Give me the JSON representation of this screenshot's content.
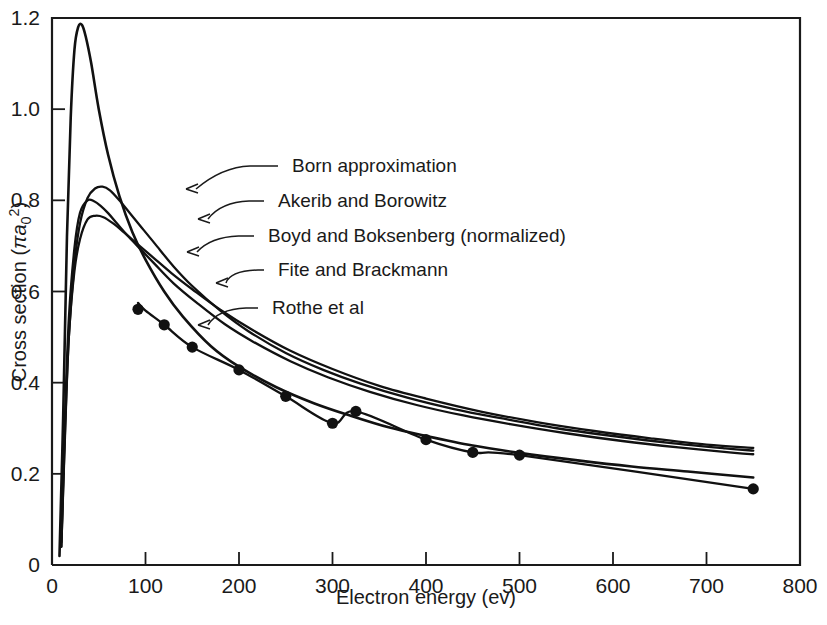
{
  "chart_data": {
    "type": "line",
    "title": "",
    "xlabel": "Electron energy (ev)",
    "ylabel": "Cross section (πa₀²)",
    "xlim": [
      0,
      800
    ],
    "ylim": [
      0,
      1.2
    ],
    "grid": false,
    "legend_position": "inline-annotations",
    "xticks": [
      0,
      100,
      200,
      300,
      400,
      500,
      600,
      700,
      800
    ],
    "xtick_labels": [
      "0",
      "100",
      "200",
      "300",
      "400",
      "500",
      "600",
      "700",
      "800"
    ],
    "yticks": [
      0,
      0.2,
      0.4,
      0.6,
      0.8,
      1.0,
      1.2
    ],
    "ytick_labels": [
      "0",
      "0.2",
      "0.4",
      "0.6",
      "0.8",
      "1.0",
      "1.2"
    ],
    "series": [
      {
        "name": "Born approximation",
        "style": "line",
        "x": [
          8,
          12,
          16,
          20,
          24,
          28,
          32,
          36,
          42,
          50,
          60,
          72,
          86,
          100,
          120,
          140,
          170,
          200,
          240,
          280,
          320,
          360,
          400,
          450,
          500,
          560,
          620,
          680,
          750
        ],
        "values": [
          0.02,
          0.33,
          0.72,
          0.98,
          1.13,
          1.18,
          1.185,
          1.16,
          1.1,
          1.0,
          0.9,
          0.81,
          0.73,
          0.67,
          0.6,
          0.545,
          0.48,
          0.435,
          0.39,
          0.355,
          0.327,
          0.302,
          0.283,
          0.262,
          0.246,
          0.23,
          0.216,
          0.205,
          0.192
        ]
      },
      {
        "name": "Akerib and Borowitz",
        "style": "line",
        "x": [
          10,
          14,
          18,
          24,
          30,
          38,
          46,
          54,
          62,
          72,
          84,
          96,
          110,
          130,
          150,
          180,
          210,
          250,
          290,
          330,
          380,
          430,
          480,
          540,
          600,
          660,
          720,
          750
        ],
        "values": [
          0.04,
          0.3,
          0.5,
          0.66,
          0.75,
          0.805,
          0.826,
          0.83,
          0.822,
          0.8,
          0.77,
          0.74,
          0.705,
          0.655,
          0.612,
          0.558,
          0.513,
          0.465,
          0.428,
          0.398,
          0.367,
          0.342,
          0.322,
          0.3,
          0.283,
          0.268,
          0.256,
          0.251
        ]
      },
      {
        "name": "Boyd and Boksenberg (normalized)",
        "style": "line",
        "x": [
          10,
          14,
          18,
          24,
          30,
          38,
          45,
          52,
          60,
          70,
          82,
          95,
          110,
          130,
          155,
          185,
          215,
          255,
          295,
          340,
          390,
          440,
          490,
          550,
          610,
          670,
          730,
          750
        ],
        "values": [
          0.05,
          0.33,
          0.54,
          0.695,
          0.773,
          0.8,
          0.798,
          0.788,
          0.772,
          0.748,
          0.72,
          0.692,
          0.66,
          0.618,
          0.575,
          0.528,
          0.49,
          0.447,
          0.412,
          0.38,
          0.351,
          0.328,
          0.309,
          0.289,
          0.272,
          0.258,
          0.246,
          0.243
        ]
      },
      {
        "name": "Fite and Brackmann",
        "style": "line",
        "x": [
          10,
          14,
          18,
          24,
          30,
          38,
          46,
          55,
          65,
          78,
          92,
          108,
          128,
          150,
          180,
          215,
          255,
          300,
          350,
          400,
          460,
          520,
          580,
          640,
          700,
          750
        ],
        "values": [
          0.04,
          0.29,
          0.5,
          0.645,
          0.715,
          0.758,
          0.766,
          0.763,
          0.75,
          0.728,
          0.703,
          0.675,
          0.64,
          0.605,
          0.56,
          0.515,
          0.47,
          0.43,
          0.393,
          0.365,
          0.336,
          0.313,
          0.294,
          0.278,
          0.264,
          0.257
        ]
      },
      {
        "name": "Rothe et al",
        "style": "line+markers",
        "x": [
          92,
          100,
          120,
          150,
          200,
          250,
          300,
          325,
          400,
          450,
          500,
          750
        ],
        "values": [
          0.575,
          0.558,
          0.527,
          0.478,
          0.428,
          0.37,
          0.311,
          0.337,
          0.275,
          0.247,
          0.241,
          0.167
        ],
        "marker_x": [
          92,
          120,
          150,
          200,
          250,
          300,
          325,
          400,
          450,
          500,
          750
        ],
        "marker_values": [
          0.561,
          0.527,
          0.478,
          0.428,
          0.37,
          0.311,
          0.337,
          0.275,
          0.247,
          0.241,
          0.167
        ]
      }
    ],
    "annotations": [
      {
        "label": "Born approximation",
        "label_x": 292,
        "label_y": 172,
        "leader_x": 186,
        "leader_y": 189
      },
      {
        "label": "Akerib and Borowitz",
        "label_x": 278,
        "label_y": 207,
        "leader_x": 198,
        "leader_y": 219
      },
      {
        "label": "Boyd and Boksenberg (normalized)",
        "label_x": 268,
        "label_y": 242,
        "leader_x": 187,
        "leader_y": 252
      },
      {
        "label": "Fite and Brackmann",
        "label_x": 278,
        "label_y": 276,
        "leader_x": 216,
        "leader_y": 283
      },
      {
        "label": "Rothe et al",
        "label_x": 272,
        "label_y": 314,
        "leader_x": 198,
        "leader_y": 325
      }
    ]
  },
  "colors": {
    "ink": "#111111",
    "background": "#ffffff"
  }
}
